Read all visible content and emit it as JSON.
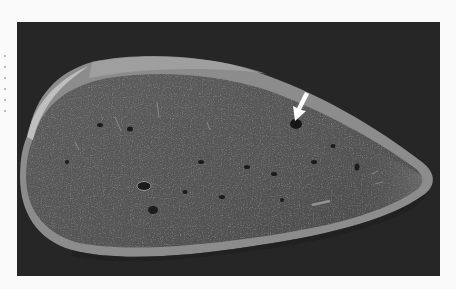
{
  "figure": {
    "kind": "grayscale specimen photograph",
    "background_color": "#262626",
    "specimen_color": "#5a5a5a",
    "capsule_color": "#9a9a9a",
    "page_color": "#fafafa"
  },
  "annotations": [
    {
      "type": "arrow",
      "color": "#ffffff",
      "direction": "down-left",
      "target": "small dark focal lesion near upper surface"
    }
  ]
}
